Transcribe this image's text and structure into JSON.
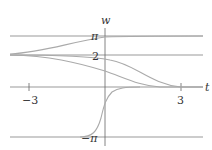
{
  "diagram": {
    "type": "solution-curves",
    "axes": {
      "horizontal_label": "t",
      "vertical_label": "w",
      "x_ticks": [
        {
          "value": -3,
          "label": "−3"
        },
        {
          "value": 3,
          "label": "3"
        }
      ],
      "y_labels": [
        {
          "value": 3.14159,
          "label": "π"
        },
        {
          "value": 2,
          "label": "2"
        },
        {
          "value": -3.14159,
          "label": "−π"
        }
      ]
    },
    "equilibrium_lines": [
      3.14159,
      2,
      0,
      -3.14159
    ],
    "curves": [
      {
        "name": "rises-from-2-to-pi",
        "points": [
          [
            -3.6,
            2.0
          ],
          [
            -2,
            2.2
          ],
          [
            -1,
            2.6
          ],
          [
            0,
            3.05
          ],
          [
            1,
            3.13
          ],
          [
            3.6,
            3.14
          ]
        ]
      },
      {
        "name": "decays-from-2-to-0-slow",
        "points": [
          [
            -3.6,
            2.0
          ],
          [
            -2,
            1.98
          ],
          [
            -1,
            1.9
          ],
          [
            0,
            1.75
          ],
          [
            1,
            1.2
          ],
          [
            2,
            0.35
          ],
          [
            3,
            0.02
          ],
          [
            3.6,
            0
          ]
        ]
      },
      {
        "name": "decays-from-2-to-0-fast",
        "points": [
          [
            -3.6,
            2.0
          ],
          [
            -2,
            1.9
          ],
          [
            -1,
            1.5
          ],
          [
            0,
            0.9
          ],
          [
            1,
            0.25
          ],
          [
            2,
            0.03
          ],
          [
            3.6,
            0
          ]
        ]
      },
      {
        "name": "rises-from-neg-pi-to-0",
        "points": [
          [
            -1.2,
            -3.14
          ],
          [
            -0.6,
            -2.9
          ],
          [
            -0.2,
            -2.0
          ],
          [
            0,
            -1.1
          ],
          [
            0.4,
            -0.35
          ],
          [
            1,
            -0.05
          ],
          [
            2,
            0
          ]
        ]
      }
    ],
    "colors": {
      "axis": "#555555",
      "equilibrium": "#bbbbbb",
      "curve": "#aaaaaa",
      "text": "#333333"
    }
  }
}
